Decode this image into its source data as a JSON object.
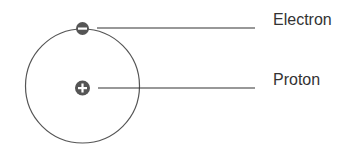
{
  "labels": {
    "electron": "Electron",
    "proton": "Proton"
  },
  "symbols": {
    "electron": "minus-sign",
    "proton": "plus-sign"
  },
  "colors": {
    "orbit": "#555555",
    "particle": "#555555",
    "line": "#333333",
    "text": "#333333"
  }
}
